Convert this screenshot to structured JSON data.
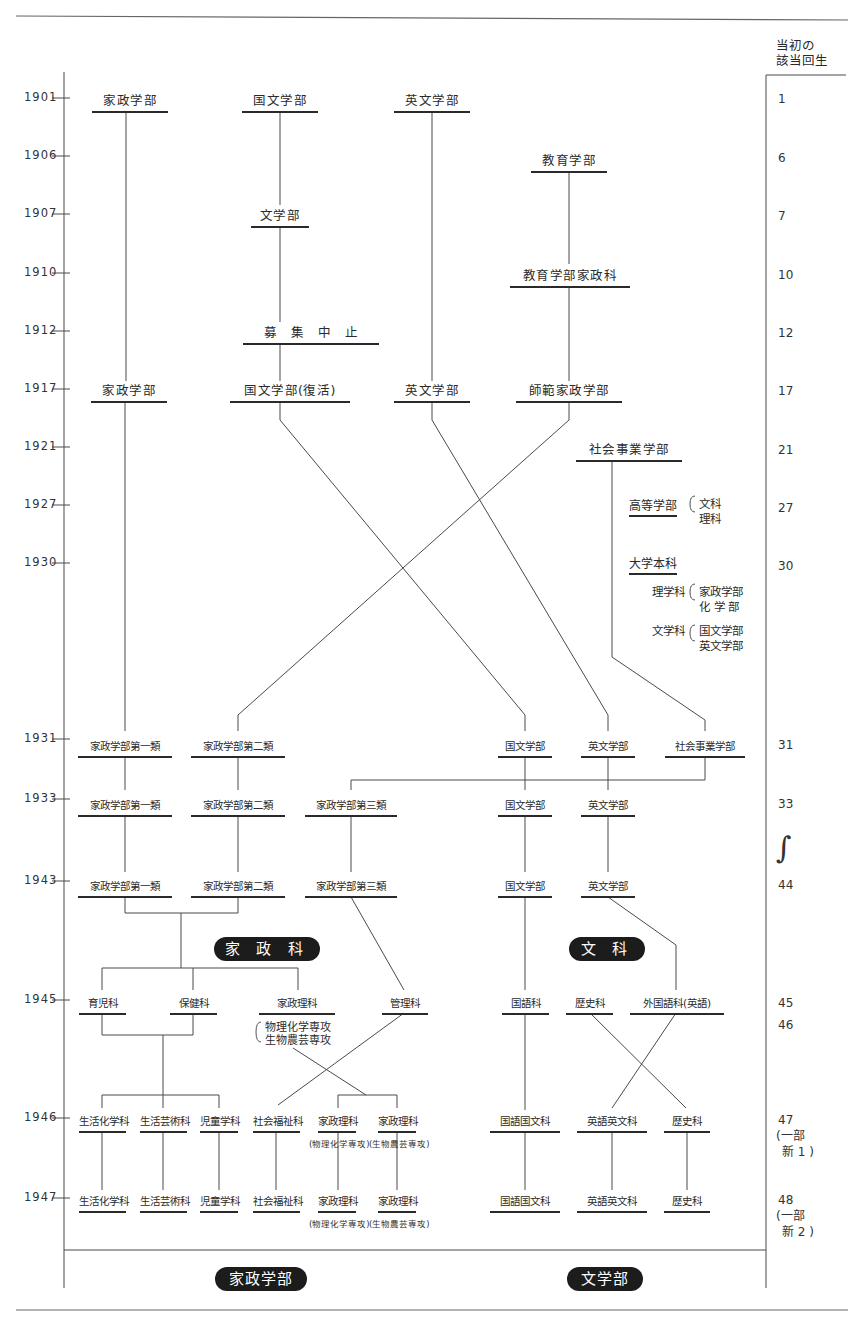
{
  "header": {
    "cohort_title_line1": "当初の",
    "cohort_title_line2": "該当回生"
  },
  "years": [
    "1901",
    "1906",
    "1907",
    "1910",
    "1912",
    "1917",
    "1921",
    "1927",
    "1930",
    "1931",
    "1933",
    "1943",
    "1945",
    "1946",
    "1947"
  ],
  "cohorts": [
    "1",
    "6",
    "7",
    "10",
    "12",
    "17",
    "21",
    "27",
    "30",
    "31",
    "33",
    "44",
    "45",
    "46",
    "47",
    "(一部",
    "㊅1)",
    "48",
    "(一部",
    "㊅2)"
  ],
  "cohort_list": {
    "c1": "1",
    "c6": "6",
    "c7": "7",
    "c10": "10",
    "c12": "12",
    "c17": "17",
    "c21": "21",
    "c27": "27",
    "c30": "30",
    "c31": "31",
    "c33": "33",
    "c44": "44",
    "c45": "45",
    "c46": "46",
    "c47": "47",
    "c47b": "(一部",
    "c47c": "新 1 )",
    "c48": "48",
    "c48b": "(一部",
    "c48c": "新 2 )",
    "gap": "∫"
  },
  "nodes": {
    "n1901_kasei": "家政学部",
    "n1901_kokubun": "国文学部",
    "n1901_eibun": "英文学部",
    "n1906_kyoiku": "教育学部",
    "n1907_bungaku": "文学部",
    "n1910_kyoiku_kasei": "教育学部家政科",
    "n1912_stop": "募　集　中　止",
    "n1917_kasei": "家政学部",
    "n1917_kokubun": "国文学部(復活)",
    "n1917_eibun": "英文学部",
    "n1917_shihan": "師範家政学部",
    "n1921_shakai": "社会事業学部",
    "n1931_k1": "家政学部第一類",
    "n1931_k2": "家政学部第二類",
    "n1931_kokubun": "国文学部",
    "n1931_eibun": "英文学部",
    "n1931_shakai": "社会事業学部",
    "n1933_k1": "家政学部第一類",
    "n1933_k2": "家政学部第二類",
    "n1933_k3": "家政学部第三類",
    "n1933_kokubun": "国文学部",
    "n1933_eibun": "英文学部",
    "n1943_k1": "家政学部第一類",
    "n1943_k2": "家政学部第二類",
    "n1943_k3": "家政学部第三類",
    "n1943_kokubun": "国文学部",
    "n1943_eibun": "英文学部",
    "n1945_ikuji": "育児科",
    "n1945_hoken": "保健科",
    "n1945_kaseiri": "家政理科",
    "n1945_kanri": "管理科",
    "n1945_kokugo": "国語科",
    "n1945_rekishi": "歴史科",
    "n1945_gaikoku": "外国語科(英語)",
    "n1945_kaseiri_sub1": "物理化学専攻",
    "n1945_kaseiri_sub2": "生物農芸専攻",
    "n1946_seikatsu_kagaku": "生活化学科",
    "n1946_seikatsu_geijutsu": "生活芸術科",
    "n1946_jido": "児童学科",
    "n1946_shakai_fukushi": "社会福祉科",
    "n1946_kaseiri_a": "家政理科",
    "n1946_kaseiri_a_sub": "(物理化学専攻)",
    "n1946_kaseiri_b": "家政理科",
    "n1946_kaseiri_b_sub": "(生物農芸専攻)",
    "n1946_kokugo_kokubun": "国語国文科",
    "n1946_eigo_eibun": "英語英文科",
    "n1946_rekishi": "歴史科",
    "n1947_seikatsu_kagaku": "生活化学科",
    "n1947_seikatsu_geijutsu": "生活芸術科",
    "n1947_jido": "児童学科",
    "n1947_shakai_fukushi": "社会福祉科",
    "n1947_kaseiri_a": "家政理科",
    "n1947_kaseiri_a_sub": "(物理化学専攻)",
    "n1947_kaseiri_b": "家政理科",
    "n1947_kaseiri_b_sub": "(生物農芸専攻)",
    "n1947_kokugo_kokubun": "国語国文科",
    "n1947_eigo_eibun": "英語英文科",
    "n1947_rekishi": "歴史科"
  },
  "notes": {
    "koto_gakubu": "高等学部",
    "koto_bunka": "文科",
    "koto_rika": "理科",
    "daigaku_honka": "大学本科",
    "rigakka": "理学科",
    "rigakka_1": "家政学部",
    "rigakka_2": "化 学 部",
    "bungakka": "文学科",
    "bungakka_1": "国文学部",
    "bungakka_2": "英文学部"
  },
  "badges": {
    "kaseika": "家 政 科",
    "bunka": "文 科",
    "kasei_gakubu": "家政学部",
    "bungakubu": "文学部"
  }
}
